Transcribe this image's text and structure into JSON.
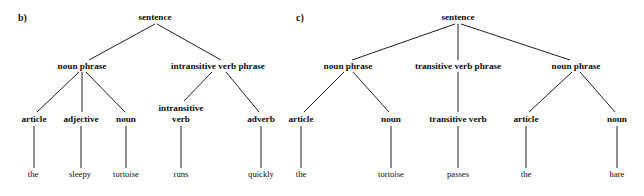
{
  "figure": {
    "background_color": "#ffffff",
    "line_color": "#1f1f1f",
    "text_color": "#0d0d0d"
  },
  "panels": [
    {
      "id": "panel-b",
      "label": "b)",
      "label_x": 18,
      "label_y": 21,
      "sentence_words": [
        "the",
        "sleepy",
        "tortoise",
        "runs",
        "quickly"
      ],
      "nodes": [
        {
          "name": "root-sentence",
          "text": "sentence",
          "x": 155,
          "y": 20,
          "kind": "nonterminal",
          "lines": [
            "sentence"
          ]
        },
        {
          "name": "noun-phrase",
          "text": "noun phrase",
          "x": 82,
          "y": 69,
          "kind": "nonterminal",
          "lines": [
            "noun phrase"
          ]
        },
        {
          "name": "intransitive-verb-phrase",
          "text": "intransitive verb phrase",
          "x": 218,
          "y": 69,
          "kind": "nonterminal",
          "lines": [
            "intransitive verb phrase"
          ]
        },
        {
          "name": "article",
          "text": "article",
          "x": 34,
          "y": 122,
          "kind": "nonterminal",
          "lines": [
            "article"
          ]
        },
        {
          "name": "adjective",
          "text": "adjective",
          "x": 81,
          "y": 122,
          "kind": "nonterminal",
          "lines": [
            "adjective"
          ]
        },
        {
          "name": "noun",
          "text": "noun",
          "x": 126,
          "y": 122,
          "kind": "nonterminal",
          "lines": [
            "noun"
          ]
        },
        {
          "name": "intransitive-verb",
          "text": "intransitive verb",
          "x": 181,
          "y": 122,
          "kind": "nonterminal",
          "lines": [
            "intransitive",
            "verb"
          ]
        },
        {
          "name": "adverb",
          "text": "adverb",
          "x": 261,
          "y": 122,
          "kind": "nonterminal",
          "lines": [
            "adverb"
          ]
        },
        {
          "name": "word-the",
          "text": "the",
          "x": 33,
          "y": 177,
          "kind": "terminal",
          "lines": [
            "the"
          ]
        },
        {
          "name": "word-sleepy",
          "text": "sleepy",
          "x": 80,
          "y": 177,
          "kind": "terminal",
          "lines": [
            "sleepy"
          ]
        },
        {
          "name": "word-tortoise",
          "text": "tortoise",
          "x": 126,
          "y": 177,
          "kind": "terminal",
          "lines": [
            "tortoise"
          ]
        },
        {
          "name": "word-runs",
          "text": "runs",
          "x": 181,
          "y": 177,
          "kind": "terminal",
          "lines": [
            "runs"
          ]
        },
        {
          "name": "word-quickly",
          "text": "quickly",
          "x": 261,
          "y": 177,
          "kind": "terminal",
          "lines": [
            "quickly"
          ]
        }
      ],
      "edges": [
        {
          "name": "edge-sentence-noun-phrase",
          "x1": 155,
          "y1": 24,
          "x2": 89,
          "y2": 60
        },
        {
          "name": "edge-sentence-intransitive-verb-phrase",
          "x1": 157,
          "y1": 24,
          "x2": 221,
          "y2": 60
        },
        {
          "name": "edge-noun-phrase-article",
          "x1": 79,
          "y1": 72,
          "x2": 37,
          "y2": 112
        },
        {
          "name": "edge-noun-phrase-adjective",
          "x1": 82,
          "y1": 72,
          "x2": 82,
          "y2": 112
        },
        {
          "name": "edge-noun-phrase-noun",
          "x1": 86,
          "y1": 72,
          "x2": 125,
          "y2": 112
        },
        {
          "name": "edge-ivp-intransitive-verb",
          "x1": 212,
          "y1": 72,
          "x2": 184,
          "y2": 101
        },
        {
          "name": "edge-ivp-adverb",
          "x1": 226,
          "y1": 72,
          "x2": 259,
          "y2": 112
        },
        {
          "name": "edge-article-the",
          "x1": 34,
          "y1": 126,
          "x2": 34,
          "y2": 168
        },
        {
          "name": "edge-adjective-sleepy",
          "x1": 81,
          "y1": 126,
          "x2": 81,
          "y2": 168
        },
        {
          "name": "edge-noun-tortoise",
          "x1": 126,
          "y1": 126,
          "x2": 126,
          "y2": 168
        },
        {
          "name": "edge-intransitive-verb-runs",
          "x1": 181,
          "y1": 126,
          "x2": 181,
          "y2": 168
        },
        {
          "name": "edge-adverb-quickly",
          "x1": 261,
          "y1": 126,
          "x2": 261,
          "y2": 168
        }
      ]
    },
    {
      "id": "panel-c",
      "label": "c)",
      "label_x": 296,
      "label_y": 21,
      "sentence_words": [
        "the",
        "tortoise",
        "passes",
        "the",
        "hare"
      ],
      "nodes": [
        {
          "name": "root-sentence",
          "text": "sentence",
          "x": 458,
          "y": 20,
          "kind": "nonterminal",
          "lines": [
            "sentence"
          ]
        },
        {
          "name": "noun-phrase-subject",
          "text": "noun phrase",
          "x": 348,
          "y": 69,
          "kind": "nonterminal",
          "lines": [
            "noun phrase"
          ]
        },
        {
          "name": "transitive-verb-phrase",
          "text": "transitive verb phrase",
          "x": 458,
          "y": 69,
          "kind": "nonterminal",
          "lines": [
            "transitive verb phrase"
          ]
        },
        {
          "name": "noun-phrase-object",
          "text": "noun phrase",
          "x": 576,
          "y": 69,
          "kind": "nonterminal",
          "lines": [
            "noun phrase"
          ]
        },
        {
          "name": "article-subject",
          "text": "article",
          "x": 301,
          "y": 122,
          "kind": "nonterminal",
          "lines": [
            "article"
          ]
        },
        {
          "name": "noun-subject",
          "text": "noun",
          "x": 391,
          "y": 122,
          "kind": "nonterminal",
          "lines": [
            "noun"
          ]
        },
        {
          "name": "transitive-verb",
          "text": "transitive verb",
          "x": 458,
          "y": 122,
          "kind": "nonterminal",
          "lines": [
            "transitive verb"
          ]
        },
        {
          "name": "article-object",
          "text": "article",
          "x": 526,
          "y": 122,
          "kind": "nonterminal",
          "lines": [
            "article"
          ]
        },
        {
          "name": "noun-object",
          "text": "noun",
          "x": 617,
          "y": 122,
          "kind": "nonterminal",
          "lines": [
            "noun"
          ]
        },
        {
          "name": "word-the-subject",
          "text": "the",
          "x": 301,
          "y": 177,
          "kind": "terminal",
          "lines": [
            "the"
          ]
        },
        {
          "name": "word-tortoise",
          "text": "tortoise",
          "x": 391,
          "y": 177,
          "kind": "terminal",
          "lines": [
            "tortoise"
          ]
        },
        {
          "name": "word-passes",
          "text": "passes",
          "x": 458,
          "y": 177,
          "kind": "terminal",
          "lines": [
            "passes"
          ]
        },
        {
          "name": "word-the-object",
          "text": "the",
          "x": 526,
          "y": 177,
          "kind": "terminal",
          "lines": [
            "the"
          ]
        },
        {
          "name": "word-hare",
          "text": "hare",
          "x": 617,
          "y": 177,
          "kind": "terminal",
          "lines": [
            "hare"
          ]
        }
      ],
      "edges": [
        {
          "name": "edge-sentence-noun-phrase-subject",
          "x1": 455,
          "y1": 24,
          "x2": 352,
          "y2": 60
        },
        {
          "name": "edge-sentence-transitive-verb-phrase",
          "x1": 458,
          "y1": 24,
          "x2": 458,
          "y2": 60
        },
        {
          "name": "edge-sentence-noun-phrase-object",
          "x1": 461,
          "y1": 24,
          "x2": 570,
          "y2": 60
        },
        {
          "name": "edge-np-subject-article",
          "x1": 344,
          "y1": 72,
          "x2": 304,
          "y2": 112
        },
        {
          "name": "edge-np-subject-noun",
          "x1": 353,
          "y1": 72,
          "x2": 389,
          "y2": 112
        },
        {
          "name": "edge-tvp-transitive-verb",
          "x1": 458,
          "y1": 72,
          "x2": 458,
          "y2": 112
        },
        {
          "name": "edge-np-object-article",
          "x1": 572,
          "y1": 72,
          "x2": 529,
          "y2": 112
        },
        {
          "name": "edge-np-object-noun",
          "x1": 580,
          "y1": 72,
          "x2": 615,
          "y2": 112
        },
        {
          "name": "edge-article-subject-the",
          "x1": 301,
          "y1": 126,
          "x2": 301,
          "y2": 168
        },
        {
          "name": "edge-noun-subject-tortoise",
          "x1": 391,
          "y1": 126,
          "x2": 391,
          "y2": 168
        },
        {
          "name": "edge-transitive-verb-passes",
          "x1": 458,
          "y1": 126,
          "x2": 458,
          "y2": 168
        },
        {
          "name": "edge-article-object-the",
          "x1": 526,
          "y1": 126,
          "x2": 526,
          "y2": 168
        },
        {
          "name": "edge-noun-object-hare",
          "x1": 617,
          "y1": 126,
          "x2": 617,
          "y2": 168
        }
      ]
    }
  ]
}
